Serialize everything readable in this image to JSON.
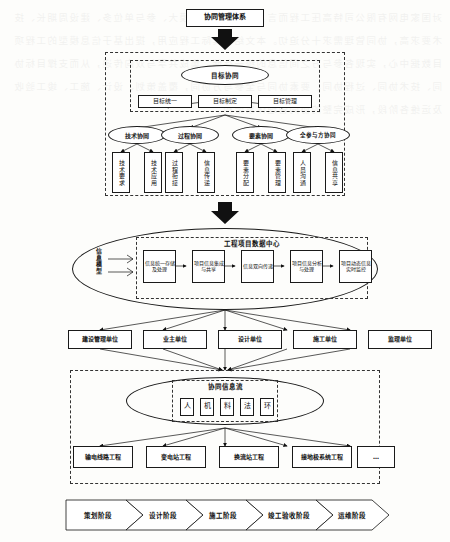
{
  "diagram": {
    "title": "协同管理体系",
    "type": "flow-hierarchy"
  },
  "top": {
    "root_label": "协同管理体系"
  },
  "collaboration_layer": {
    "goal": {
      "ellipse": "目标协同",
      "boxes": [
        "目标统一",
        "目标制定",
        "目标管理"
      ]
    },
    "branches": [
      {
        "ellipse": "技术协同",
        "boxes": [
          "技术要求",
          "技术应用"
        ]
      },
      {
        "ellipse": "过程协同",
        "boxes": [
          "过程衔接",
          "信息传递"
        ]
      },
      {
        "ellipse": "要素协同",
        "boxes": [
          "要素分配",
          "要素管理"
        ]
      },
      {
        "ellipse": "全参与方协同",
        "boxes": [
          "人员沟通",
          "信息共享"
        ]
      }
    ]
  },
  "data_center": {
    "side_label": "信息模型",
    "title": "工程项目数据中心",
    "boxes": [
      "信息统一存储及处理",
      "项目信息集成与共享",
      "信息双向传递",
      "项目信息分析与处理",
      "项目动态信息实时监控"
    ]
  },
  "participants": {
    "items": [
      "建设管理单位",
      "业主单位",
      "设计单位",
      "施工单位",
      "监理单位"
    ]
  },
  "info_flow": {
    "ellipse_title": "协同信息流",
    "elements": [
      "人",
      "机",
      "料",
      "法",
      "环"
    ],
    "projects": [
      "输电线路工程",
      "变电站工程",
      "换流站工程",
      "接地极系统工程",
      "…"
    ]
  },
  "phases": {
    "items": [
      "策划阶段",
      "设计阶段",
      "施工阶段",
      "竣工验收阶段",
      "运维阶段"
    ]
  },
  "colors": {
    "ink": "#1a1a1a",
    "paper": "#fdfdfb",
    "dashed": "#333333"
  },
  "bleed_text": "对国家电网有限公司特高压工程而言，其工程建设规模大、参与单位多、建设周期长、技术要求高，协同管理需求十分迫切。本文结合实际工程应用，提出基于信息模型的工程项目数据中心，实现各参与方之间信息的统一存储、集成共享与双向传递，从而支撑目标协同、技术协同、过程协同、要素协同与全参与方协同，覆盖策划、设计、施工、竣工验收及运维各阶段，形成完整的协同管理体系架构。"
}
